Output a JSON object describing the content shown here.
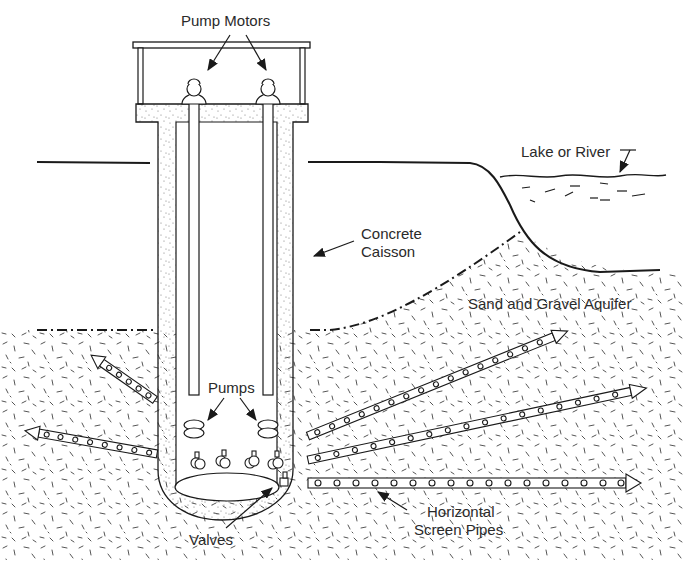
{
  "diagram": {
    "type": "cross-section",
    "labels": {
      "pump_motors": "Pump Motors",
      "lake_or_river": "Lake or River",
      "concrete_caisson": "Concrete Caisson",
      "concrete_caisson_line1": "Concrete",
      "concrete_caisson_line2": "Caisson",
      "aquifer": "Sand and Gravel Aquifer",
      "pumps": "Pumps",
      "valves": "Valves",
      "screen_pipes_line1": "Horizontal",
      "screen_pipes_line2": "Screen Pipes"
    },
    "components": [
      {
        "id": "pump-house",
        "description": "Roof structure over caisson"
      },
      {
        "id": "pump-motor",
        "count": 2
      },
      {
        "id": "pump-column",
        "count": 2
      },
      {
        "id": "pump",
        "count": 2
      },
      {
        "id": "valve",
        "count": 4
      },
      {
        "id": "concrete-caisson",
        "description": "Vertical concrete shaft with rounded bottom"
      },
      {
        "id": "horizontal-screen-pipe",
        "count": 5,
        "directions": [
          "upper-left",
          "left",
          "upper-right",
          "right",
          "right-horizontal"
        ]
      },
      {
        "id": "water-table",
        "style": "dash-dot line"
      },
      {
        "id": "ground-surface"
      },
      {
        "id": "lake-or-river"
      },
      {
        "id": "aquifer-fill",
        "pattern": "speckled sand and gravel"
      }
    ],
    "colors": {
      "line": "#1a1a1a",
      "background": "#ffffff",
      "text": "#2a2a2a",
      "speckle": "#555555"
    }
  }
}
